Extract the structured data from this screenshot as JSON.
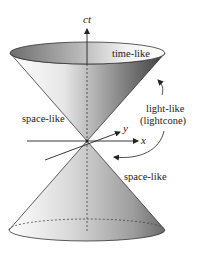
{
  "diagram": {
    "type": "spacetime light cone",
    "axes": {
      "time_axis_label": "ct",
      "x_axis_label": "x",
      "y_axis_label": "y"
    },
    "labels": {
      "future_interior": "time-like",
      "left_exterior": "space-like",
      "right_exterior": "space-like",
      "cone_surface_line1": "light-like",
      "cone_surface_line2": "(lightcone)"
    },
    "colors": {
      "background": "#ffffff",
      "outline": "#333333",
      "cone_light": "#f4f4f4",
      "cone_dark": "#555555",
      "top_cap_dark": "#777777"
    }
  }
}
